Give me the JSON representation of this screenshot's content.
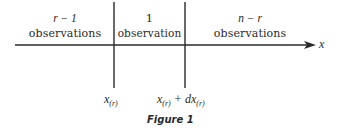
{
  "figure": {
    "caption": "Figure 1",
    "axis_label": "x",
    "regions": [
      {
        "count": "r − 1",
        "label": "observations"
      },
      {
        "count": "1",
        "label": "observation"
      },
      {
        "count": "n − r",
        "label": "observations"
      }
    ],
    "markers": [
      {
        "var": "x",
        "sub": "(r)",
        "suffix": ""
      },
      {
        "var": "x",
        "sub": "(r)",
        "suffix": " + dx",
        "suffix_sub": "(r)"
      }
    ],
    "colors": {
      "ink": "#2a2a2a",
      "background": "#ffffff"
    }
  }
}
